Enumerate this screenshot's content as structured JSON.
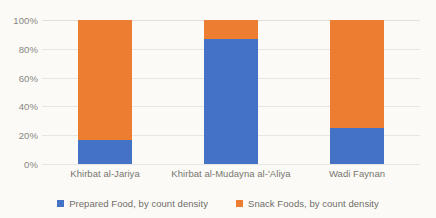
{
  "chart_data": {
    "type": "bar",
    "subtype": "100% stacked bar",
    "title": "",
    "subtitle": "",
    "xlabel": "",
    "ylabel": "",
    "ylim": [
      0,
      100
    ],
    "yticks": [
      "0%",
      "20%",
      "40%",
      "60%",
      "80%",
      "100%"
    ],
    "ytick_values": [
      0,
      20,
      40,
      60,
      80,
      100
    ],
    "grid": true,
    "legend_position": "bottom",
    "categories": [
      "Khirbat al-Jariya",
      "Khirbat al-Mudayna al-'Aliya",
      "Wadi Faynan"
    ],
    "series": [
      {
        "name": "Prepared Food, by count density",
        "color": "#4472c4",
        "values": [
          17,
          87,
          25
        ]
      },
      {
        "name": "Snack Foods, by count density",
        "color": "#ed7d31",
        "values": [
          83,
          13,
          75
        ]
      }
    ]
  },
  "colors": {
    "prepared_food": "#4472c4",
    "snack_foods": "#ed7d31",
    "gridline": "#e8e6e2",
    "tick_text": "#888680",
    "label_text": "#78766f",
    "background": "#fbfaf7"
  }
}
